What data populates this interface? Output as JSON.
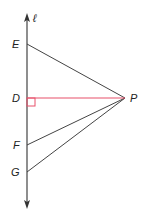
{
  "diagram": {
    "line_label": "ℓ",
    "points": {
      "E": {
        "label": "E",
        "x": 27,
        "y": 44
      },
      "D": {
        "label": "D",
        "x": 27,
        "y": 98
      },
      "F": {
        "label": "F",
        "x": 27,
        "y": 145
      },
      "G": {
        "label": "G",
        "x": 27,
        "y": 172
      },
      "P": {
        "label": "P",
        "x": 125,
        "y": 98
      }
    },
    "segments": [
      "EP",
      "DP",
      "FP",
      "GP"
    ],
    "perpendicular_segment": "DP",
    "right_angle_at": "D",
    "colors": {
      "line": "#333333",
      "perpendicular": "#e8506a"
    }
  }
}
